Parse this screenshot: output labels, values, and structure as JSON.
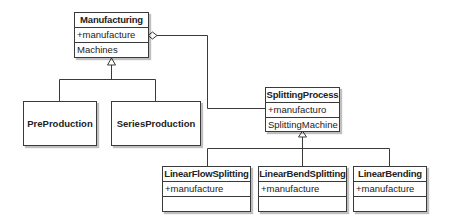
{
  "diagram": {
    "type": "uml-class-diagram",
    "classes": [
      {
        "name": "Manufacturing",
        "attributes": [
          "+manufacture"
        ],
        "operations": [
          "Machines"
        ]
      },
      {
        "name": "PreProduction"
      },
      {
        "name": "SeriesProduction"
      },
      {
        "name": "SplittingProcess",
        "attributes": [
          "+manufacturo"
        ],
        "operations": [
          "SplittingMachine"
        ]
      },
      {
        "name": "LinearFlowSplitting",
        "attributes": [
          "+manufacture"
        ],
        "operations": [
          ""
        ]
      },
      {
        "name": "LinearBendSplitting",
        "attributes": [
          "+manufacture"
        ],
        "operations": [
          ""
        ]
      },
      {
        "name": "LinearBending",
        "attributes": [
          "+manufacture"
        ],
        "operations": [
          ""
        ]
      }
    ],
    "relations": [
      {
        "type": "generalization",
        "from": "PreProduction",
        "to": "Manufacturing"
      },
      {
        "type": "generalization",
        "from": "SeriesProduction",
        "to": "Manufacturing"
      },
      {
        "type": "aggregation",
        "whole": "Manufacturing",
        "part": "SplittingProcess"
      },
      {
        "type": "generalization",
        "from": "LinearFlowSplitting",
        "to": "SplittingProcess"
      },
      {
        "type": "generalization",
        "from": "LinearBendSplitting",
        "to": "SplittingProcess"
      },
      {
        "type": "generalization",
        "from": "LinearBending",
        "to": "SplittingProcess"
      }
    ]
  }
}
